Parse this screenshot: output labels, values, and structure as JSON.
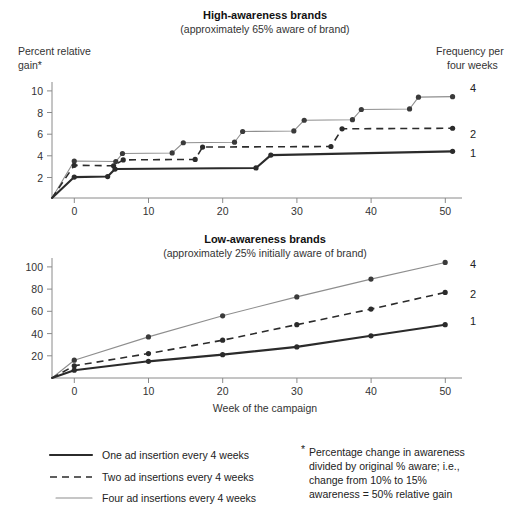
{
  "figure": {
    "x_axis_title": "Week of the campaign"
  },
  "panels": [
    {
      "key": "high",
      "title": "High-awareness brands",
      "subtitle": "(approximately 65% aware of brand)",
      "y_axis_label_line1": "Percent relative",
      "y_axis_label_line2": "gain*",
      "right_header_line1": "Frequency per",
      "right_header_line2": "four weeks",
      "y_ticks": [
        2,
        4,
        6,
        8,
        10
      ],
      "x_ticks": [
        0,
        10,
        20,
        30,
        40,
        50
      ],
      "end_labels": [
        "4",
        "2",
        "1"
      ]
    },
    {
      "key": "low",
      "title": "Low-awareness brands",
      "subtitle": "(approximately 25% initially aware of brand)",
      "y_ticks": [
        20,
        40,
        60,
        80,
        100
      ],
      "x_ticks": [
        0,
        10,
        20,
        30,
        40,
        50
      ],
      "end_labels": [
        "4",
        "2",
        "1"
      ]
    }
  ],
  "legend": {
    "items": [
      {
        "style": "thick-solid",
        "label": "One ad insertion every 4 weeks"
      },
      {
        "style": "dashed",
        "label": "Two ad insertions every 4 weeks"
      },
      {
        "style": "thin-solid",
        "label": "Four ad insertions every 4 weeks"
      }
    ]
  },
  "footnote": {
    "marker": "*",
    "lines": [
      "Percentage change in awareness",
      "divided by original % aware; i.e.,",
      "change from 10% to 15%",
      "awareness = 50% relative gain"
    ]
  },
  "colors": {
    "one_ad": "#2b2b2b",
    "two_ads": "#2b2b2b",
    "four_ads": "#8e8e8e",
    "axis": "#8a8a8a",
    "text": "#222222"
  },
  "chart_data": [
    {
      "type": "line",
      "id": "high-awareness-brands",
      "title": "High-awareness brands",
      "subtitle": "(approximately 65% aware of brand)",
      "xlabel": "Week of the campaign",
      "ylabel": "Percent relative gain*",
      "xlim": [
        -3,
        52
      ],
      "ylim": [
        0,
        11
      ],
      "xticks": [
        0,
        10,
        20,
        30,
        40,
        50
      ],
      "yticks": [
        2,
        4,
        6,
        8,
        10
      ],
      "grid": false,
      "legend_position": "right-end-labels",
      "step_shaped": true,
      "series": [
        {
          "name": "One ad insertion every 4 weeks",
          "end_label": "1",
          "style": "thick-solid",
          "points": [
            {
              "x": -3,
              "y": 0.0
            },
            {
              "x": 0,
              "y": 1.95
            },
            {
              "x": 4.5,
              "y": 2.0
            },
            {
              "x": 5.5,
              "y": 2.7
            },
            {
              "x": 24.5,
              "y": 2.8
            },
            {
              "x": 26.5,
              "y": 4.0
            },
            {
              "x": 51,
              "y": 4.35
            }
          ],
          "markers": [
            {
              "x": 0,
              "y": 1.95
            },
            {
              "x": 4.5,
              "y": 2.0
            },
            {
              "x": 5.5,
              "y": 2.7
            },
            {
              "x": 24.5,
              "y": 2.8
            },
            {
              "x": 26.5,
              "y": 4.0
            },
            {
              "x": 51,
              "y": 4.35
            }
          ]
        },
        {
          "name": "Two ad insertions every 4 weeks",
          "end_label": "2",
          "style": "dashed",
          "points": [
            {
              "x": -3,
              "y": 0.0
            },
            {
              "x": 0,
              "y": 3.05
            },
            {
              "x": 5.3,
              "y": 3.0
            },
            {
              "x": 6.6,
              "y": 3.55
            },
            {
              "x": 16.3,
              "y": 3.6
            },
            {
              "x": 17.3,
              "y": 4.75
            },
            {
              "x": 34.6,
              "y": 4.8
            },
            {
              "x": 36.1,
              "y": 6.45
            },
            {
              "x": 51,
              "y": 6.5
            }
          ],
          "markers": [
            {
              "x": 0,
              "y": 3.05
            },
            {
              "x": 5.3,
              "y": 3.0
            },
            {
              "x": 6.6,
              "y": 3.55
            },
            {
              "x": 16.3,
              "y": 3.6
            },
            {
              "x": 17.3,
              "y": 4.75
            },
            {
              "x": 34.6,
              "y": 4.8
            },
            {
              "x": 36.1,
              "y": 6.45
            },
            {
              "x": 51,
              "y": 6.5
            }
          ]
        },
        {
          "name": "Four ad insertions every 4 weeks",
          "end_label": "4",
          "style": "thin-solid",
          "points": [
            {
              "x": -3,
              "y": 0.0
            },
            {
              "x": 0,
              "y": 3.45
            },
            {
              "x": 5.6,
              "y": 3.4
            },
            {
              "x": 6.5,
              "y": 4.15
            },
            {
              "x": 13.2,
              "y": 4.2
            },
            {
              "x": 14.7,
              "y": 5.15
            },
            {
              "x": 21.6,
              "y": 5.2
            },
            {
              "x": 22.7,
              "y": 6.2
            },
            {
              "x": 29.6,
              "y": 6.25
            },
            {
              "x": 31.0,
              "y": 7.25
            },
            {
              "x": 37.5,
              "y": 7.3
            },
            {
              "x": 38.7,
              "y": 8.25
            },
            {
              "x": 45.2,
              "y": 8.3
            },
            {
              "x": 46.4,
              "y": 9.4
            },
            {
              "x": 51,
              "y": 9.45
            }
          ],
          "markers": [
            {
              "x": 0,
              "y": 3.45
            },
            {
              "x": 5.6,
              "y": 3.4
            },
            {
              "x": 6.5,
              "y": 4.15
            },
            {
              "x": 13.2,
              "y": 4.2
            },
            {
              "x": 14.7,
              "y": 5.15
            },
            {
              "x": 21.6,
              "y": 5.2
            },
            {
              "x": 22.7,
              "y": 6.2
            },
            {
              "x": 29.6,
              "y": 6.25
            },
            {
              "x": 31.0,
              "y": 7.25
            },
            {
              "x": 37.5,
              "y": 7.3
            },
            {
              "x": 38.7,
              "y": 8.25
            },
            {
              "x": 45.2,
              "y": 8.3
            },
            {
              "x": 46.4,
              "y": 9.4
            },
            {
              "x": 51,
              "y": 9.45
            }
          ]
        }
      ]
    },
    {
      "type": "line",
      "id": "low-awareness-brands",
      "title": "Low-awareness brands",
      "subtitle": "(approximately 25% initially aware of brand)",
      "xlabel": "Week of the campaign",
      "ylabel": "Percent relative gain*",
      "xlim": [
        -3,
        52
      ],
      "ylim": [
        0,
        108
      ],
      "xticks": [
        0,
        10,
        20,
        30,
        40,
        50
      ],
      "yticks": [
        20,
        40,
        60,
        80,
        100
      ],
      "grid": false,
      "legend_position": "right-end-labels",
      "step_shaped": false,
      "series": [
        {
          "name": "One ad insertion every 4 weeks",
          "end_label": "1",
          "style": "thick-solid",
          "x": [
            -3,
            0,
            10,
            20,
            30,
            40,
            50
          ],
          "y": [
            0,
            7,
            15,
            21,
            28,
            38,
            48
          ]
        },
        {
          "name": "Two ad insertions every 4 weeks",
          "end_label": "2",
          "style": "dashed",
          "x": [
            -3,
            0,
            10,
            20,
            30,
            40,
            50
          ],
          "y": [
            0,
            11,
            22,
            34,
            48,
            62,
            77
          ]
        },
        {
          "name": "Four ad insertions every 4 weeks",
          "end_label": "4",
          "style": "thin-solid",
          "x": [
            -3,
            0,
            10,
            20,
            30,
            40,
            50
          ],
          "y": [
            0,
            16,
            37,
            56,
            73,
            89,
            104
          ]
        }
      ]
    }
  ]
}
